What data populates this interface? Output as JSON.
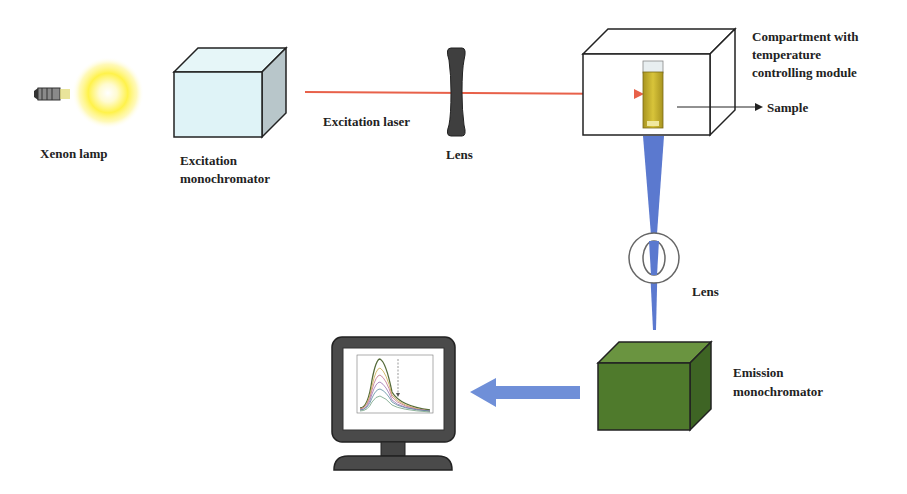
{
  "diagram": {
    "labels": {
      "xenon_lamp": "Xenon lamp",
      "excitation_monochromator_line1": "Excitation",
      "excitation_monochromator_line2": "monochromator",
      "excitation_laser": "Excitation laser",
      "lens_top": "Lens",
      "compartment_line1": "Compartment with",
      "compartment_line2": "temperature",
      "compartment_line3": "controlling module",
      "sample": "Sample",
      "lens_vertical": "Lens",
      "emission_monochromator_line1": "Emission",
      "emission_monochromator_line2": "monochromator"
    },
    "components": [
      {
        "id": "xenon-lamp",
        "type": "light-source"
      },
      {
        "id": "excitation-monochromator",
        "type": "box",
        "color": "#dff3f7"
      },
      {
        "id": "excitation-laser",
        "type": "beam",
        "color": "#e8614a"
      },
      {
        "id": "lens-horizontal",
        "type": "lens",
        "color": "#3a3a3a"
      },
      {
        "id": "sample-compartment",
        "type": "box",
        "color": "#ffffff"
      },
      {
        "id": "sample-cuvette",
        "type": "cuvette",
        "color": "#c9b52a"
      },
      {
        "id": "emission-beam",
        "type": "beam",
        "color": "#5b79cf"
      },
      {
        "id": "lens-vertical",
        "type": "lens"
      },
      {
        "id": "emission-monochromator",
        "type": "box",
        "color": "#4f7a2c"
      },
      {
        "id": "signal-arrow",
        "type": "arrow",
        "color": "#6f8fd8"
      },
      {
        "id": "computer-monitor",
        "type": "display"
      }
    ],
    "colors": {
      "laser": "#e8614a",
      "emission_beam": "#5b79cf",
      "arrow": "#6f8fd8",
      "excitation_box": "#dff3f7",
      "emission_box": "#4f7a2c",
      "lamp_glow": "#fff25a",
      "monitor": "#4a4a4a"
    }
  }
}
